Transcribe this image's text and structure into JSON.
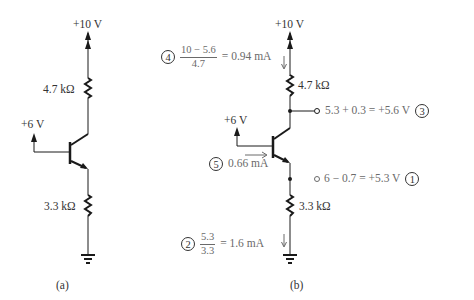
{
  "circuit_a": {
    "supply_label": "+10 V",
    "collector_resistor": "4.7 kΩ",
    "base_voltage": "+6 V",
    "emitter_resistor": "3.3 kΩ",
    "caption": "(a)"
  },
  "circuit_b": {
    "supply_label": "+10 V",
    "collector_resistor": "4.7 kΩ",
    "base_voltage": "+6 V",
    "emitter_resistor": "3.3 kΩ",
    "caption": "(b)",
    "steps": [
      {
        "number": "1",
        "expression": "6 − 0.7 = +5.3 V"
      },
      {
        "number": "2",
        "numerator": "5.3",
        "denominator": "3.3",
        "result": "= 1.6 mA"
      },
      {
        "number": "3",
        "expression": "5.3 + 0.3 = +5.6 V"
      },
      {
        "number": "4",
        "numerator": "10 − 5.6",
        "denominator": "4.7",
        "result": "= 0.94 mA"
      },
      {
        "number": "5",
        "expression": "0.66 mA"
      }
    ]
  },
  "colors": {
    "circuit": "#1a1a1a",
    "annotation": "#6a6a6a"
  }
}
